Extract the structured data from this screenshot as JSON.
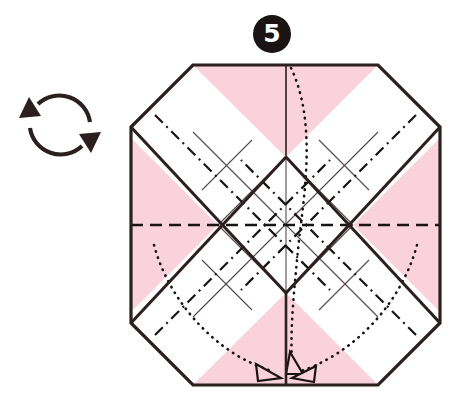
{
  "diagram": {
    "step_number": "5",
    "step_badge_name": "step-number-badge",
    "paper_shape": "octagon",
    "colors": {
      "paper_front": "#f9d2dc",
      "paper_back": "#ffffff",
      "outline": "#2b1f20",
      "crease_thin": "#4a4446",
      "fold_dark": "#1a1414",
      "background": "#ffffff"
    },
    "symbols": {
      "rotate_icon": "rotate-arrows-icon",
      "rotate_label": "turn over / rotate",
      "arrowhead_label": "fold-arrowhead",
      "arrowhead_count": "3"
    },
    "legend": {
      "valley_fold": "dashed line",
      "mountain_fold": "dash-dot line",
      "existing_crease": "thin solid line",
      "hidden_edge": "dotted line",
      "paper_edge": "thick solid line"
    },
    "geometry": {
      "octagon_left": "131",
      "octagon_right": "440",
      "octagon_top": "65",
      "octagon_bottom": "385",
      "corner_cut": "62",
      "center_x": "286",
      "center_y": "225"
    }
  }
}
